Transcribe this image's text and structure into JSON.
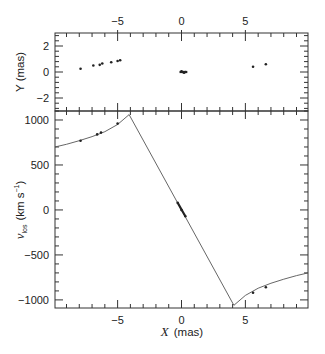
{
  "chart_data": [
    {
      "panel": "top",
      "type": "scatter",
      "xlabel": "X (mas)",
      "ylabel": "Y (mas)",
      "xlim": [
        -9.9,
        9.9
      ],
      "ylim": [
        -3,
        3
      ],
      "x_ticks": [
        -5,
        0,
        5
      ],
      "x_tick_labels": [
        "−5",
        "0",
        "5"
      ],
      "x_tick_position": "top",
      "y_ticks": [
        -2,
        0,
        2
      ],
      "y_tick_labels": [
        "−2",
        "0",
        "2"
      ],
      "grid": false,
      "points": [
        {
          "x": -7.9,
          "y": 0.25
        },
        {
          "x": -6.9,
          "y": 0.5
        },
        {
          "x": -6.4,
          "y": 0.55
        },
        {
          "x": -6.2,
          "y": 0.65
        },
        {
          "x": -5.5,
          "y": 0.75
        },
        {
          "x": -5.0,
          "y": 0.85
        },
        {
          "x": -4.8,
          "y": 0.9
        },
        {
          "x": 0.0,
          "y": 0.05
        },
        {
          "x": 0.1,
          "y": 0.0
        },
        {
          "x": 0.2,
          "y": -0.05
        },
        {
          "x": 0.3,
          "y": 0.0
        },
        {
          "x": 5.6,
          "y": 0.4
        },
        {
          "x": 6.6,
          "y": 0.6
        }
      ]
    },
    {
      "panel": "bottom",
      "type": "line",
      "xlabel": "X (mas)",
      "ylabel": "v_los (km s^-1)",
      "xlim": [
        -9.9,
        9.9
      ],
      "ylim": [
        -1090,
        1100
      ],
      "x_ticks": [
        -5,
        0,
        5
      ],
      "x_tick_labels": [
        "−5",
        "0",
        "5"
      ],
      "y_ticks": [
        -1000,
        -500,
        0,
        500,
        1000
      ],
      "y_tick_labels": [
        "−1000",
        "−500",
        "0",
        "500",
        "1000"
      ],
      "grid": false,
      "model_curve": {
        "x": [
          -9.9,
          -9.0,
          -8.0,
          -7.0,
          -6.0,
          -5.0,
          -4.1,
          0.0,
          4.1,
          5.0,
          6.0,
          7.0,
          8.0,
          9.0,
          9.9
        ],
        "y": [
          700,
          730,
          770,
          815,
          870,
          950,
          1060,
          0,
          -1060,
          -950,
          -870,
          -815,
          -770,
          -730,
          -700
        ]
      },
      "points": [
        {
          "x": -7.9,
          "y": 770
        },
        {
          "x": -6.6,
          "y": 840
        },
        {
          "x": -6.3,
          "y": 860
        },
        {
          "x": -5.0,
          "y": 960
        },
        {
          "x": -0.3,
          "y": 80
        },
        {
          "x": 0.0,
          "y": 0
        },
        {
          "x": 0.3,
          "y": -70
        },
        {
          "x": 5.6,
          "y": -920
        },
        {
          "x": 6.6,
          "y": -860
        }
      ]
    }
  ],
  "labels": {
    "top_ylabel": "Y (mas)",
    "bottom_ylabel_main": "v",
    "bottom_ylabel_sub": "los",
    "bottom_ylabel_units": "(km s",
    "bottom_ylabel_sup": "−1",
    "bottom_ylabel_close": ")",
    "xlabel_var": "X",
    "xlabel_units": "(mas)"
  }
}
